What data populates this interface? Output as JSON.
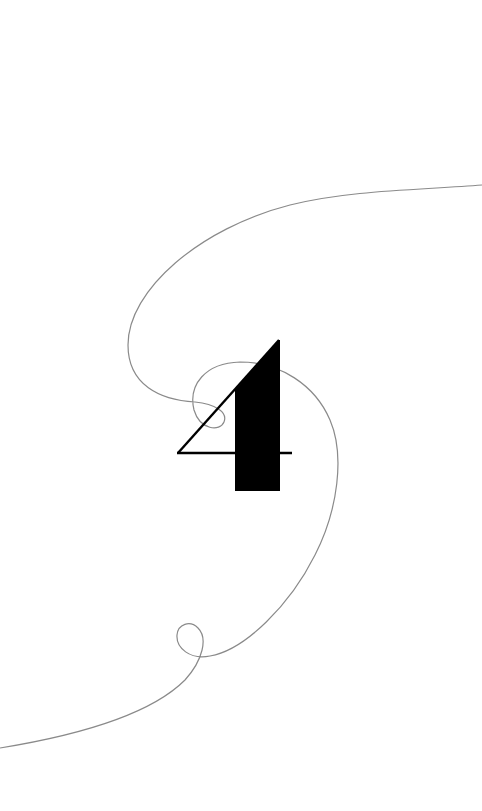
{
  "artwork": {
    "description": "Stylized numeral four with a thin looping line",
    "numeral": "4",
    "colors": {
      "background": "#ffffff",
      "numeral_fill": "#000000",
      "numeral_stroke": "#000000",
      "curve_stroke": "#8a8a8a"
    }
  }
}
